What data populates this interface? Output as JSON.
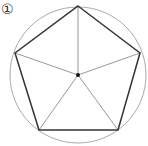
{
  "figure": {
    "label": "①",
    "circle": {
      "cx": 78,
      "cy": 75,
      "r": 68,
      "color": "#aaaaaa"
    },
    "center_point": {
      "x": 78,
      "y": 75,
      "color": "#111111"
    },
    "vertices": [
      {
        "x": 78,
        "y": 6
      },
      {
        "x": 140,
        "y": 53
      },
      {
        "x": 118,
        "y": 130
      },
      {
        "x": 39,
        "y": 130
      },
      {
        "x": 15,
        "y": 53
      }
    ],
    "pentagon_color": "#333333",
    "radius_color": "#999999"
  }
}
